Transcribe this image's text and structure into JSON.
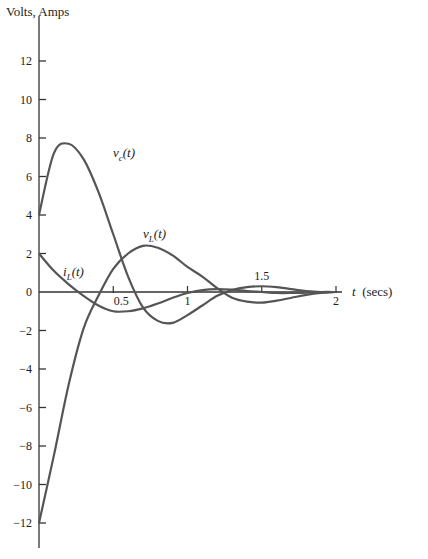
{
  "chart_data": {
    "type": "line",
    "title": "",
    "xlabel": "t (secs)",
    "ylabel": "Volts, Amps",
    "xlim": [
      0,
      2.1
    ],
    "ylim": [
      -13,
      14
    ],
    "grid": false,
    "legend": "inline labels",
    "x_ticks": [
      0.5,
      1,
      1.5,
      2
    ],
    "x_tick_labels": [
      "0.5",
      "1",
      "1.5",
      "2"
    ],
    "y_ticks": [
      12,
      10,
      8,
      6,
      4,
      2,
      0,
      -2,
      -4,
      -6,
      -8,
      -10,
      -12
    ],
    "y_tick_labels": [
      "12",
      "10",
      "8",
      "6",
      "4",
      "2",
      "0",
      "−2",
      "−4",
      "−6",
      "−8",
      "−10",
      "−12"
    ],
    "x": [
      0,
      0.1,
      0.2,
      0.3,
      0.4,
      0.5,
      0.6,
      0.7,
      0.8,
      0.9,
      1.0,
      1.1,
      1.2,
      1.3,
      1.4,
      1.5,
      1.6,
      1.7,
      1.8,
      1.9,
      2.0
    ],
    "series": [
      {
        "name": "v_c(t)",
        "label": "vc(t)",
        "values": [
          4.0,
          7.2,
          7.7,
          6.9,
          5.2,
          3.0,
          0.8,
          -0.8,
          -1.5,
          -1.6,
          -1.2,
          -0.7,
          -0.2,
          0.1,
          0.25,
          0.3,
          0.25,
          0.15,
          0.05,
          0.0,
          0.0
        ]
      },
      {
        "name": "v_L(t)",
        "label": "vL(t)",
        "values": [
          -12.0,
          -8.5,
          -4.8,
          -1.9,
          -0.2,
          1.2,
          2.0,
          2.4,
          2.3,
          1.9,
          1.3,
          0.8,
          0.2,
          -0.3,
          -0.5,
          -0.55,
          -0.45,
          -0.3,
          -0.15,
          -0.05,
          0.0
        ]
      },
      {
        "name": "i_L(t)",
        "label": "iL(t)",
        "values": [
          2.0,
          1.1,
          0.4,
          -0.2,
          -0.7,
          -1.0,
          -1.0,
          -0.85,
          -0.6,
          -0.3,
          -0.05,
          0.1,
          0.15,
          0.12,
          0.05,
          0.0,
          -0.05,
          -0.05,
          -0.03,
          0.0,
          0.0
        ]
      }
    ],
    "annotations": [
      {
        "text": "vc(t)",
        "x": 0.55,
        "y": 7.0
      },
      {
        "text": "vL(t)",
        "x": 0.72,
        "y": 2.8
      },
      {
        "text": "iL(t)",
        "x": 0.1,
        "y": 0.7
      }
    ]
  },
  "labels": {
    "ylabel": "Volts, Amps",
    "xlabel_var": "t",
    "xlabel_unit": "(secs)",
    "vc": "v",
    "vc_sub": "c",
    "vL": "v",
    "vL_sub": "L",
    "iL": "i",
    "iL_sub": "L",
    "arg": "(t)"
  },
  "colors": {
    "curve": "#555555",
    "axis": "#333333",
    "text": "#222222"
  }
}
